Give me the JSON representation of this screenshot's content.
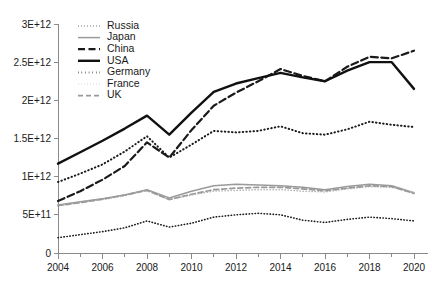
{
  "chart_data": {
    "type": "line",
    "title": "",
    "subtitle": "",
    "xlabel": "",
    "ylabel": "",
    "grid": false,
    "legend_position": "top-left-inside",
    "x": [
      2004,
      2005,
      2006,
      2007,
      2008,
      2009,
      2010,
      2011,
      2012,
      2013,
      2014,
      2015,
      2016,
      2017,
      2018,
      2019,
      2020
    ],
    "xlim": [
      2004,
      2020
    ],
    "ylim": [
      0,
      3000000000000
    ],
    "x_tick_labels": [
      "2004",
      "2006",
      "2008",
      "2010",
      "2012",
      "2014",
      "2016",
      "2018",
      "2020"
    ],
    "x_tick_values": [
      2004,
      2006,
      2008,
      2010,
      2012,
      2014,
      2016,
      2018,
      2020
    ],
    "x_minor_tick_values": [
      2005,
      2007,
      2009,
      2011,
      2013,
      2015,
      2017,
      2019
    ],
    "y_tick_labels": [
      "0",
      "5E+11",
      "1E+12",
      "1.5E+12",
      "2E+12",
      "2.5E+12",
      "3E+12"
    ],
    "y_tick_values": [
      0,
      500000000000,
      1000000000000,
      1500000000000,
      2000000000000,
      2500000000000,
      3000000000000
    ],
    "series": [
      {
        "name": "Russia",
        "style": "dotted",
        "color": "#1a1a1a",
        "width": 1.6,
        "dash": "0.4,2.6",
        "values": [
          200000000000,
          240000000000,
          280000000000,
          330000000000,
          420000000000,
          340000000000,
          390000000000,
          470000000000,
          500000000000,
          520000000000,
          500000000000,
          430000000000,
          400000000000,
          440000000000,
          470000000000,
          450000000000,
          420000000000
        ]
      },
      {
        "name": "Japan",
        "style": "solid",
        "color": "#9a9a9a",
        "width": 1.5,
        "dash": "none",
        "values": [
          630000000000,
          670000000000,
          710000000000,
          760000000000,
          830000000000,
          720000000000,
          810000000000,
          880000000000,
          900000000000,
          890000000000,
          880000000000,
          860000000000,
          830000000000,
          870000000000,
          900000000000,
          880000000000,
          790000000000
        ]
      },
      {
        "name": "China",
        "style": "dashed",
        "color": "#1a1a1a",
        "width": 2.2,
        "dash": "7,3.5",
        "values": [
          680000000000,
          810000000000,
          960000000000,
          1140000000000,
          1450000000000,
          1250000000000,
          1610000000000,
          1930000000000,
          2100000000000,
          2250000000000,
          2410000000000,
          2320000000000,
          2250000000000,
          2440000000000,
          2570000000000,
          2550000000000,
          2650000000000
        ]
      },
      {
        "name": "USA",
        "style": "solid",
        "color": "#111111",
        "width": 2.4,
        "dash": "none",
        "values": [
          1170000000000,
          1320000000000,
          1470000000000,
          1630000000000,
          1800000000000,
          1550000000000,
          1840000000000,
          2110000000000,
          2220000000000,
          2290000000000,
          2360000000000,
          2300000000000,
          2250000000000,
          2390000000000,
          2500000000000,
          2500000000000,
          2150000000000
        ]
      },
      {
        "name": "Germany",
        "style": "dotted",
        "color": "#1a1a1a",
        "width": 2.0,
        "dash": "0.5,3.1",
        "values": [
          930000000000,
          1040000000000,
          1160000000000,
          1330000000000,
          1530000000000,
          1250000000000,
          1420000000000,
          1600000000000,
          1580000000000,
          1600000000000,
          1660000000000,
          1570000000000,
          1550000000000,
          1620000000000,
          1720000000000,
          1680000000000,
          1650000000000
        ]
      },
      {
        "name": "France",
        "style": "dotted",
        "color": "#b8b8b8",
        "width": 1.5,
        "dash": "0.4,2.6",
        "values": [
          620000000000,
          660000000000,
          700000000000,
          750000000000,
          820000000000,
          700000000000,
          760000000000,
          810000000000,
          820000000000,
          830000000000,
          830000000000,
          810000000000,
          800000000000,
          840000000000,
          870000000000,
          860000000000,
          790000000000
        ]
      },
      {
        "name": "UK",
        "style": "dashed",
        "color": "#9a9a9a",
        "width": 1.7,
        "dash": "5,3",
        "values": [
          620000000000,
          660000000000,
          705000000000,
          760000000000,
          820000000000,
          700000000000,
          770000000000,
          830000000000,
          850000000000,
          860000000000,
          860000000000,
          840000000000,
          815000000000,
          850000000000,
          880000000000,
          870000000000,
          780000000000
        ]
      }
    ]
  },
  "legend": {
    "items": [
      {
        "label": "Russia"
      },
      {
        "label": "Japan"
      },
      {
        "label": "China"
      },
      {
        "label": "USA"
      },
      {
        "label": "Germany"
      },
      {
        "label": "France"
      },
      {
        "label": "UK"
      }
    ]
  },
  "colors": {
    "background": "#ffffff",
    "axis": "#8a8a8a",
    "text": "#1a1a1a",
    "gray_series": "#9a9a9a",
    "light_gray_series": "#b8b8b8",
    "black_series": "#111111"
  }
}
